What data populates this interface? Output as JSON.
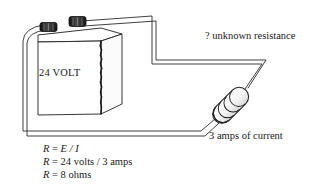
{
  "figure": {
    "colors": {
      "ink": "#1a1a1a",
      "wire_stroke": "#2b2b2b",
      "wire_fill": "#ffffff",
      "terminal_dark": "#2a2a2a",
      "resistor_body": "#f2f2f2",
      "band_fill": "#e8e8e8",
      "background": "#ffffff"
    }
  },
  "battery": {
    "label": "24 VOLT",
    "terminals": [
      {
        "name": "negative-terminal"
      },
      {
        "name": "positive-terminal"
      }
    ]
  },
  "resistor": {
    "label": "? unknown resistance",
    "bands": 4
  },
  "current": {
    "label": "3 amps of current"
  },
  "formulas": {
    "line1": {
      "left": "R",
      "eq": " = ",
      "right": "E / I"
    },
    "line2": {
      "left": "R",
      "eq": " = ",
      "right": "24 volts / 3 amps"
    },
    "line3": {
      "left": "R",
      "eq": " = ",
      "right": "8 ohms"
    }
  }
}
